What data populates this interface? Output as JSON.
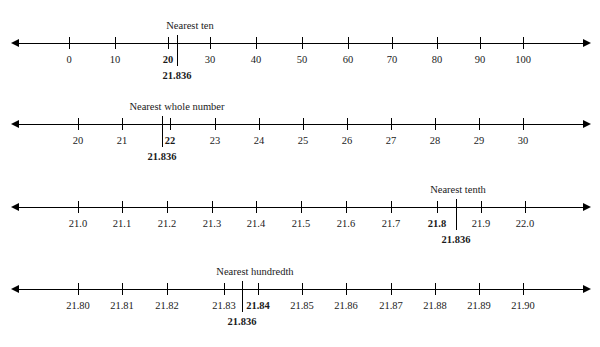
{
  "figure": {
    "value_label": "21.836",
    "axis_color": "#000000"
  },
  "chart_data": {
    "type": "line",
    "title": "Rounding 21.836 on number lines",
    "xlabel": "",
    "ylabel": "",
    "grid": false,
    "legend": "none",
    "annotations": [
      "Nearest ten",
      "Nearest whole number",
      "Nearest tenth",
      "Nearest hundredth"
    ],
    "lines": [
      {
        "caption": "Nearest ten",
        "caption_x": 190,
        "axis_y": 43,
        "ticks": [
          {
            "label": "0",
            "x": 69,
            "rounded": false
          },
          {
            "label": "10",
            "x": 115,
            "rounded": false
          },
          {
            "label": "20",
            "x": 168,
            "rounded": true
          },
          {
            "label": "30",
            "x": 210,
            "rounded": false
          },
          {
            "label": "40",
            "x": 256,
            "rounded": false
          },
          {
            "label": "50",
            "x": 302,
            "rounded": false
          },
          {
            "label": "60",
            "x": 348,
            "rounded": false
          },
          {
            "label": "70",
            "x": 392,
            "rounded": false
          },
          {
            "label": "80",
            "x": 437,
            "rounded": false
          },
          {
            "label": "90",
            "x": 480,
            "rounded": false
          },
          {
            "label": "100",
            "x": 523,
            "rounded": false
          }
        ],
        "pointer_x": 177,
        "pointer_label": "21.836",
        "pointer_label_x": 177,
        "rounded_to": "20",
        "range": [
          0,
          100
        ],
        "step": 10
      },
      {
        "caption": "Nearest whole number",
        "caption_x": 177,
        "axis_y": 124,
        "ticks": [
          {
            "label": "20",
            "x": 78,
            "rounded": false
          },
          {
            "label": "21",
            "x": 122,
            "rounded": false
          },
          {
            "label": "22",
            "x": 170,
            "rounded": true
          },
          {
            "label": "23",
            "x": 215,
            "rounded": false
          },
          {
            "label": "24",
            "x": 259,
            "rounded": false
          },
          {
            "label": "25",
            "x": 303,
            "rounded": false
          },
          {
            "label": "26",
            "x": 347,
            "rounded": false
          },
          {
            "label": "27",
            "x": 391,
            "rounded": false
          },
          {
            "label": "28",
            "x": 435,
            "rounded": false
          },
          {
            "label": "29",
            "x": 479,
            "rounded": false
          },
          {
            "label": "30",
            "x": 523,
            "rounded": false
          }
        ],
        "pointer_x": 162,
        "pointer_label": "21.836",
        "pointer_label_x": 162,
        "rounded_to": "22",
        "range": [
          20,
          30
        ],
        "step": 1
      },
      {
        "caption": "Nearest tenth",
        "caption_x": 458,
        "axis_y": 207,
        "ticks": [
          {
            "label": "21.0",
            "x": 78,
            "rounded": false
          },
          {
            "label": "21.1",
            "x": 122,
            "rounded": false
          },
          {
            "label": "21.2",
            "x": 167,
            "rounded": false
          },
          {
            "label": "21.3",
            "x": 212,
            "rounded": false
          },
          {
            "label": "21.4",
            "x": 256,
            "rounded": false
          },
          {
            "label": "21.5",
            "x": 301,
            "rounded": false
          },
          {
            "label": "21.6",
            "x": 346,
            "rounded": false
          },
          {
            "label": "21.7",
            "x": 391,
            "rounded": false
          },
          {
            "label": "21.8",
            "x": 437,
            "rounded": true
          },
          {
            "label": "21.9",
            "x": 481,
            "rounded": false
          },
          {
            "label": "22.0",
            "x": 525,
            "rounded": false
          }
        ],
        "pointer_x": 456,
        "pointer_label": "21.836",
        "pointer_label_x": 456,
        "rounded_to": "21.8",
        "range": [
          21.0,
          22.0
        ],
        "step": 0.1
      },
      {
        "caption": "Nearest hundredth",
        "caption_x": 255,
        "axis_y": 289,
        "ticks": [
          {
            "label": "21.80",
            "x": 78,
            "rounded": false
          },
          {
            "label": "21.81",
            "x": 122,
            "rounded": false
          },
          {
            "label": "21.82",
            "x": 167,
            "rounded": false
          },
          {
            "label": "21.83",
            "x": 224,
            "rounded": false
          },
          {
            "label": "21.84",
            "x": 258,
            "rounded": true
          },
          {
            "label": "21.85",
            "x": 302,
            "rounded": false
          },
          {
            "label": "21.86",
            "x": 346,
            "rounded": false
          },
          {
            "label": "21.87",
            "x": 391,
            "rounded": false
          },
          {
            "label": "21.88",
            "x": 435,
            "rounded": false
          },
          {
            "label": "21.89",
            "x": 479,
            "rounded": false
          },
          {
            "label": "21.90",
            "x": 523,
            "rounded": false
          }
        ],
        "pointer_x": 242,
        "pointer_label": "21.836",
        "pointer_label_x": 242,
        "rounded_to": "21.84",
        "range": [
          21.8,
          21.9
        ],
        "step": 0.01
      }
    ]
  }
}
